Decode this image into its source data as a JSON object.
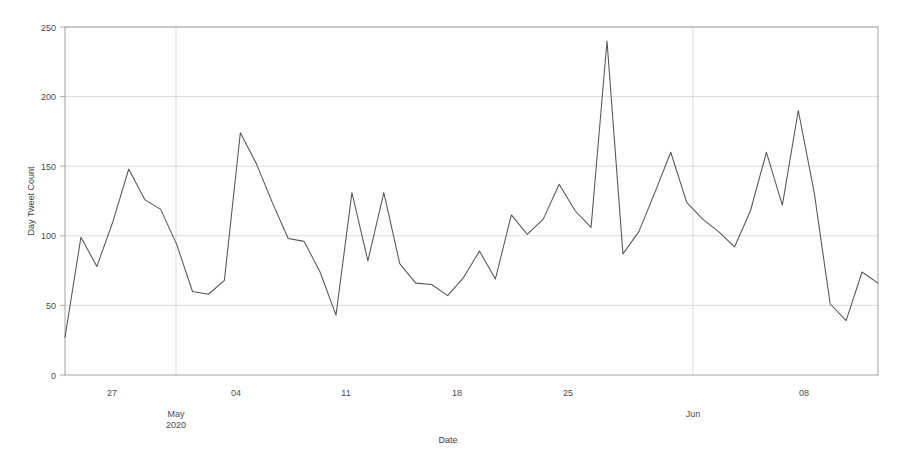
{
  "chart_data": {
    "type": "line",
    "title": "",
    "xlabel": "Date",
    "ylabel": "Day Tweet Count",
    "ylim": [
      0,
      250
    ],
    "yticks": [
      0,
      50,
      100,
      150,
      200,
      250
    ],
    "ytick_labels": [
      "0",
      "50",
      "100",
      "150",
      "200",
      "250"
    ],
    "xtick_labels": [
      "27",
      "04",
      "11",
      "18",
      "25",
      "08"
    ],
    "xtick_dates": [
      "2020-04-27",
      "2020-05-04",
      "2020-05-11",
      "2020-05-18",
      "2020-05-25",
      "2020-06-08"
    ],
    "month_labels": [
      {
        "label": "May",
        "sublabel": "2020",
        "date": "2020-05-01"
      },
      {
        "label": "Jun",
        "sublabel": "",
        "date": "2020-06-01"
      }
    ],
    "grid": true,
    "legend": "none",
    "line_color": "#555555",
    "grid_color": "#cfcfcf",
    "x": [
      "2020-04-24",
      "2020-04-25",
      "2020-04-26",
      "2020-04-27",
      "2020-04-28",
      "2020-04-29",
      "2020-04-30",
      "2020-05-01",
      "2020-05-02",
      "2020-05-03",
      "2020-05-04",
      "2020-05-05",
      "2020-05-06",
      "2020-05-07",
      "2020-05-08",
      "2020-05-09",
      "2020-05-10",
      "2020-05-11",
      "2020-05-12",
      "2020-05-13",
      "2020-05-14",
      "2020-05-15",
      "2020-05-16",
      "2020-05-17",
      "2020-05-18",
      "2020-05-19",
      "2020-05-20",
      "2020-05-21",
      "2020-05-22",
      "2020-05-23",
      "2020-05-24",
      "2020-05-25",
      "2020-05-26",
      "2020-05-27",
      "2020-05-28",
      "2020-05-29",
      "2020-05-30",
      "2020-05-31",
      "2020-06-01",
      "2020-06-02",
      "2020-06-03",
      "2020-06-04",
      "2020-06-05",
      "2020-06-06",
      "2020-06-07",
      "2020-06-08",
      "2020-06-09",
      "2020-06-10",
      "2020-06-11",
      "2020-06-12",
      "2020-06-13",
      "2020-06-14"
    ],
    "values": [
      27,
      99,
      78,
      110,
      148,
      126,
      119,
      94,
      60,
      58,
      68,
      174,
      152,
      124,
      98,
      96,
      74,
      43,
      131,
      82,
      131,
      80,
      66,
      65,
      57,
      70,
      89,
      69,
      115,
      101,
      112,
      137,
      118,
      106,
      240,
      87,
      103,
      131,
      160,
      124,
      112,
      103,
      92,
      118,
      160,
      122,
      190,
      131,
      51,
      39,
      74,
      66
    ],
    "series_name": "Day Tweet Count"
  },
  "axes": {
    "y_axis_title": "Day Tweet Count",
    "x_axis_title": "Date"
  }
}
